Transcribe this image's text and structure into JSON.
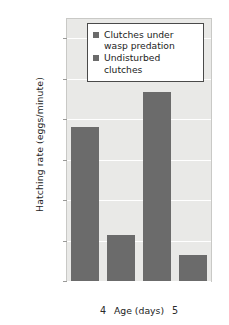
{
  "chart_data": {
    "type": "bar",
    "title": "",
    "xlabel": "Age (days)",
    "ylabel": "Hatching rate (eggs/minute)",
    "categories": [
      "4",
      "5"
    ],
    "yscale": "log",
    "ylim": [
      0.0001,
      300
    ],
    "yticks": [
      "0.0001",
      "0.001",
      "0.01",
      "0.1",
      "1",
      "10",
      "100"
    ],
    "ytick_values": [
      0.0001,
      0.001,
      0.01,
      0.1,
      1,
      10,
      100
    ],
    "grid": true,
    "legend_position": "upper center",
    "series": [
      {
        "name": "Clutches under wasp predation",
        "values": [
          0.65,
          4.6
        ],
        "color": "#6b6b6b"
      },
      {
        "name": "Undisturbed clutches",
        "values": [
          0.0014,
          0.00045
        ],
        "color": "#6b6b6b"
      }
    ],
    "colors": {
      "bar": "#6b6b6b",
      "plot_background": "#e9e9e7",
      "gridline": "#ffffff",
      "text": "#1c1c1c"
    }
  },
  "legend": {
    "items": [
      {
        "label": "Clutches under wasp predation"
      },
      {
        "label": "Undisturbed clutches"
      }
    ]
  },
  "axes": {
    "y_title": "Hatching rate (eggs/minute)",
    "x_title": "Age (days)",
    "y_ticks": [
      "100",
      "10",
      "1",
      "0.1",
      "0.01",
      "0.001",
      "0.0001"
    ],
    "x_ticks": [
      "4",
      "5"
    ]
  }
}
